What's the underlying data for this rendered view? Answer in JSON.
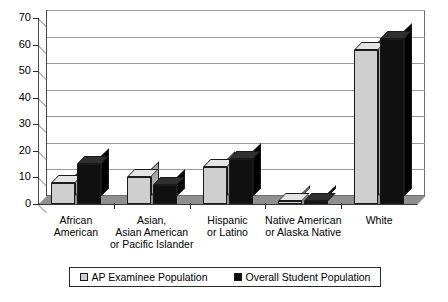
{
  "chart_data": {
    "type": "bar",
    "title": "",
    "subtitle": "",
    "xlabel": "",
    "ylabel": "",
    "ylim": [
      0,
      70
    ],
    "ytick_step": 10,
    "yticks": [
      0,
      10,
      20,
      30,
      40,
      50,
      60,
      70
    ],
    "grid": true,
    "legend_position": "bottom",
    "style": "3d-clustered-column",
    "categories": [
      "African American",
      "Asian, Asian American or Pacific Islander",
      "Hispanic or Latino",
      "Native American or Alaska Native",
      "White"
    ],
    "category_label_lines": [
      [
        "African",
        "American"
      ],
      [
        "Asian,",
        "Asian American",
        "or Pacific Islander"
      ],
      [
        "Hispanic",
        "or Latino"
      ],
      [
        "Native American",
        "or Alaska Native"
      ],
      [
        "White"
      ]
    ],
    "series": [
      {
        "name": "AP Examinee Population",
        "color": "#cfcfcf",
        "values": [
          8,
          10,
          14,
          1,
          58
        ]
      },
      {
        "name": "Overall Student Population",
        "color": "#0d0d0d",
        "values": [
          15,
          7,
          17,
          1,
          62
        ]
      }
    ]
  },
  "axis": {
    "y_tick_labels": [
      "70",
      "60",
      "50",
      "40",
      "30",
      "20",
      "10",
      "0"
    ]
  },
  "legend": {
    "items": [
      {
        "label": "AP Examinee Population",
        "swatch": "light"
      },
      {
        "label": "Overall Student Population",
        "swatch": "dark"
      }
    ]
  }
}
